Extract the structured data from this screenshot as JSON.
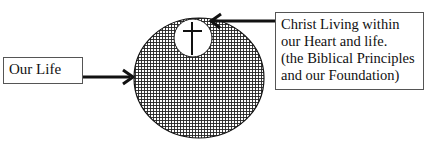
{
  "diagram": {
    "left_label": "Our Life",
    "right_label_lines": [
      "Christ Living within",
      "our Heart and life.",
      "(the Biblical Principles",
      "and our Foundation)"
    ],
    "symbol": "cross-icon",
    "colors": {
      "line": "#111111",
      "fill_pattern": "#222222",
      "background": "#ffffff"
    }
  }
}
